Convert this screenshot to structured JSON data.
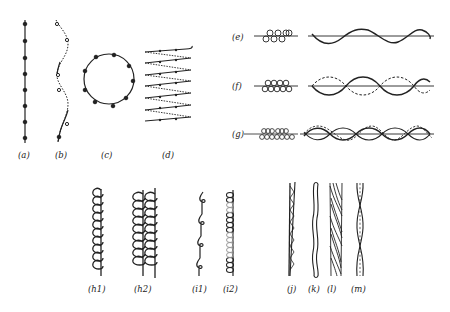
{
  "figure": {
    "panels": [
      {
        "id": "a",
        "label": "(a)"
      },
      {
        "id": "b",
        "label": "(b)"
      },
      {
        "id": "c",
        "label": "(c)"
      },
      {
        "id": "d",
        "label": "(d)"
      },
      {
        "id": "e",
        "label": "(e)"
      },
      {
        "id": "f",
        "label": "(f)"
      },
      {
        "id": "g",
        "label": "(g)"
      },
      {
        "id": "h1",
        "label": "(h1)"
      },
      {
        "id": "h2",
        "label": "(h2)"
      },
      {
        "id": "i1",
        "label": "(i1)"
      },
      {
        "id": "i2",
        "label": "(i2)"
      },
      {
        "id": "j",
        "label": "(j)"
      },
      {
        "id": "k",
        "label": "(k)"
      },
      {
        "id": "l",
        "label": "(l)"
      },
      {
        "id": "m",
        "label": "(m)"
      }
    ],
    "colors": {
      "ink": "#222222",
      "faint": "#999999",
      "background": "#ffffff"
    }
  }
}
